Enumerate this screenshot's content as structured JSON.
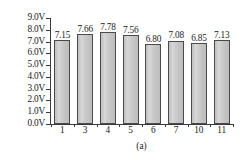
{
  "chart_data": {
    "type": "bar",
    "title": "",
    "subtitle": "",
    "caption": "(a)",
    "xlabel": "",
    "ylabel": "",
    "categories": [
      "1",
      "3",
      "4",
      "5",
      "6",
      "7",
      "10",
      "11"
    ],
    "values": [
      7.15,
      7.66,
      7.78,
      7.56,
      6.8,
      7.08,
      6.85,
      7.13
    ],
    "data_labels": [
      "7.15",
      "7.66",
      "7.78",
      "7.56",
      "6.80",
      "7.08",
      "6.85",
      "7.13"
    ],
    "ylim": [
      0,
      9
    ],
    "ytick_step": 1,
    "ytick_values": [
      9.0,
      8.0,
      7.0,
      6.0,
      5.0,
      4.0,
      3.0,
      2.0,
      1.0,
      0.0
    ],
    "ytick_labels": [
      "9.0V",
      "8.0V",
      "7.0V",
      "6.0V",
      "5.0V",
      "4.0V",
      "3.0V",
      "2.0V",
      "1.0V",
      "0.0V"
    ],
    "unit": "V",
    "grid": false,
    "legend": null,
    "legend_position": "none",
    "axis_style": "open-left-bottom",
    "colors": {
      "bar_fill": "#cacaca",
      "bar_edge": "#4a4a4a",
      "axis": "#3a3a3a",
      "text": "#1a1a1a",
      "background": "#ffffff"
    }
  }
}
